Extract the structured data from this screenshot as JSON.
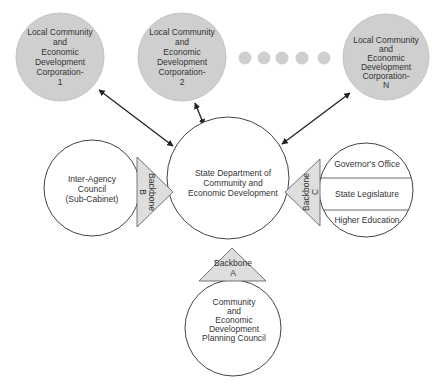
{
  "colors": {
    "corp_fill": "#cfcfcf",
    "triangle_fill": "#dedede",
    "stroke": "#444444",
    "text": "#333333",
    "background": "#ffffff"
  },
  "local_corporations": [
    {
      "lines": [
        "Local Community",
        "and",
        "Economic",
        "Development",
        "Corporation-",
        "1"
      ]
    },
    {
      "lines": [
        "Local Community",
        "and",
        "Economic",
        "Development",
        "Corporation-",
        "2"
      ]
    },
    {
      "lines": [
        "Local Community",
        "and",
        "Economic",
        "Development",
        "Corporation-",
        "N"
      ]
    }
  ],
  "ellipsis_dots": 5,
  "center": {
    "lines": [
      "State Department of",
      "Community and",
      "Economic Development"
    ]
  },
  "inter_agency": {
    "lines": [
      "Inter-Agency",
      "Council",
      "(Sub-Cabinet)"
    ]
  },
  "backbones": {
    "a": {
      "lines": [
        "Backbone",
        "A"
      ]
    },
    "b": {
      "lines": [
        "Backbone",
        "B"
      ]
    },
    "c": {
      "lines": [
        "Backbone",
        "C"
      ]
    }
  },
  "right_group": {
    "sections": [
      "Governor's Office",
      "State Legislature",
      "Higher Education"
    ]
  },
  "planning_council": {
    "lines": [
      "Community",
      "and",
      "Economic",
      "Development",
      "Planning Council"
    ]
  }
}
